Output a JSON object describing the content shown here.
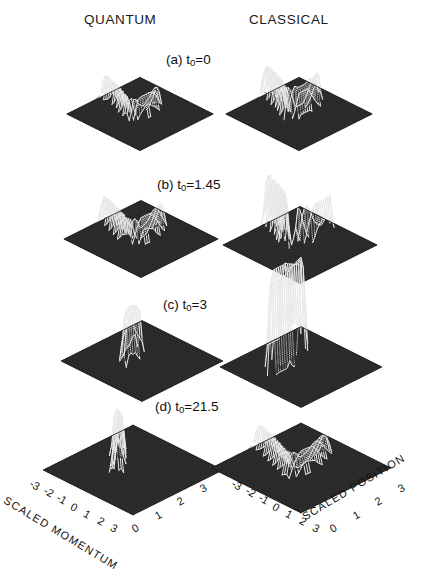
{
  "figure": {
    "background": "#ffffff",
    "ink": "#111111",
    "surface_dark": "#2b2b2b",
    "surface_light": "#e8e8e8"
  },
  "columns": [
    {
      "id": "quantum",
      "label": "QUANTUM"
    },
    {
      "id": "classical",
      "label": "CLASSICAL"
    }
  ],
  "rows": [
    {
      "id": "a",
      "label": "(a) t",
      "sub": "0",
      "eq": "=0"
    },
    {
      "id": "b",
      "label": "(b) t",
      "sub": "0",
      "eq": "=1.45"
    },
    {
      "id": "c",
      "label": "(c) t",
      "sub": "0",
      "eq": "=3"
    },
    {
      "id": "d",
      "label": "(d) t",
      "sub": "0",
      "eq": "=21.5"
    }
  ],
  "axes": {
    "momentum": {
      "title": "SCALED MOMENTUM",
      "ticks": [
        "-3",
        "-2",
        "-1",
        "0",
        "1",
        "2",
        "3"
      ]
    },
    "position": {
      "title": "SCALED POSITION",
      "ticks": [
        "0",
        "1",
        "2",
        "3"
      ]
    }
  },
  "chart_data": {
    "type": "surface",
    "xlabel": "SCALED POSITION",
    "ylabel": "SCALED MOMENTUM",
    "zlabel": "",
    "xlim": [
      -3,
      3
    ],
    "ylim": [
      -3,
      3
    ],
    "grid": true,
    "legend": false,
    "projection": "3d-mesh",
    "view": {
      "azimuth": -45,
      "elevation": 30
    },
    "panels": [
      {
        "id": "a-quantum",
        "row": "a",
        "column": "QUANTUM",
        "time_label": "(a) t0=0",
        "time_value": 0,
        "feature": "folded filament forming a hook ridge running from mid-left across to upper-right then bending down",
        "peak_height_rel": 0.3,
        "ridge_points": [
          [
            -2.9,
            0.15
          ],
          [
            -2.1,
            0.3
          ],
          [
            -1.3,
            0.55
          ],
          [
            -0.6,
            0.85
          ],
          [
            0.1,
            1.1
          ],
          [
            0.5,
            0.75
          ],
          [
            0.6,
            0.1
          ],
          [
            0.5,
            -0.6
          ],
          [
            0.3,
            -1.2
          ]
        ]
      },
      {
        "id": "a-classical",
        "row": "a",
        "column": "CLASSICAL",
        "time_label": "(a) t0=0",
        "time_value": 0,
        "feature": "narrow comb-like ridge rising to a sharp vertical blade at the apex then a thin tail descending",
        "peak_height_rel": 0.4,
        "ridge_points": [
          [
            -2.9,
            0.05
          ],
          [
            -2.1,
            0.25
          ],
          [
            -1.2,
            0.55
          ],
          [
            -0.4,
            0.95
          ],
          [
            0.2,
            1.15
          ],
          [
            0.45,
            0.55
          ],
          [
            0.45,
            -0.2
          ],
          [
            0.3,
            -0.9
          ],
          [
            0.15,
            -1.5
          ]
        ]
      },
      {
        "id": "b-quantum",
        "row": "b",
        "column": "QUANTUM",
        "time_label": "(b) t0=1.45",
        "time_value": 1.45,
        "feature": "broader hooked ridge, stretched filament with a blunt elbow",
        "peak_height_rel": 0.34,
        "ridge_points": [
          [
            -2.9,
            0.2
          ],
          [
            -2.0,
            0.45
          ],
          [
            -1.1,
            0.75
          ],
          [
            -0.3,
            1.0
          ],
          [
            0.3,
            1.05
          ],
          [
            0.55,
            0.45
          ],
          [
            0.5,
            -0.3
          ],
          [
            0.3,
            -1.0
          ],
          [
            0.1,
            -1.6
          ]
        ]
      },
      {
        "id": "b-classical",
        "row": "b",
        "column": "CLASSICAL",
        "time_label": "(b) t0=1.45",
        "time_value": 1.45,
        "feature": "comb of growing spikes rising to a tall blade, plus a separate descending filament branch",
        "peak_height_rel": 0.62,
        "ridge_points": [
          [
            -2.6,
            0.1
          ],
          [
            -1.9,
            0.3
          ],
          [
            -1.2,
            0.55
          ],
          [
            -0.5,
            0.85
          ],
          [
            0.0,
            1.2
          ]
        ],
        "branch_points": [
          [
            0.35,
            0.55
          ],
          [
            0.55,
            0.0
          ],
          [
            0.7,
            -0.6
          ],
          [
            0.75,
            -1.2
          ],
          [
            0.7,
            -1.8
          ]
        ]
      },
      {
        "id": "c-quantum",
        "row": "c",
        "column": "QUANTUM",
        "time_label": "(c) t0=3",
        "time_value": 3,
        "feature": "single tall narrow peak near centre with slight skirt, rest of surface flat",
        "peak_height_rel": 0.78,
        "ridge_points": [
          [
            -0.1,
            0.25
          ],
          [
            0.0,
            0.9
          ],
          [
            0.05,
            1.3
          ]
        ]
      },
      {
        "id": "c-classical",
        "row": "c",
        "column": "CLASSICAL",
        "time_label": "(c) t0=3",
        "time_value": 3,
        "feature": "extremely tall thin spike extending far above the flat mesh; delta-like collapse",
        "peak_height_rel": 1.0,
        "ridge_points": [
          [
            0.25,
            0.2
          ],
          [
            0.3,
            1.6
          ],
          [
            0.3,
            2.6
          ]
        ]
      },
      {
        "id": "d-quantum",
        "row": "d",
        "column": "QUANTUM",
        "time_label": "(d) t0=21.5",
        "time_value": 21.5,
        "feature": "single broadened peak with a short trailing filament toward lower-left",
        "peak_height_rel": 0.7,
        "ridge_points": [
          [
            -1.1,
            0.1
          ],
          [
            -0.5,
            0.35
          ],
          [
            -0.1,
            0.8
          ],
          [
            0.05,
            1.25
          ]
        ]
      },
      {
        "id": "d-classical",
        "row": "d",
        "column": "CLASSICAL",
        "time_label": "(d) t0=21.5",
        "time_value": 21.5,
        "feature": "hooked filament ridge again, similar to (a) classical but smoother and flatter",
        "peak_height_rel": 0.32,
        "ridge_points": [
          [
            -2.9,
            0.1
          ],
          [
            -2.0,
            0.3
          ],
          [
            -1.1,
            0.6
          ],
          [
            -0.3,
            0.9
          ],
          [
            0.3,
            1.05
          ],
          [
            0.5,
            0.45
          ],
          [
            0.45,
            -0.3
          ],
          [
            0.25,
            -1.0
          ],
          [
            0.05,
            -1.7
          ]
        ]
      }
    ]
  }
}
